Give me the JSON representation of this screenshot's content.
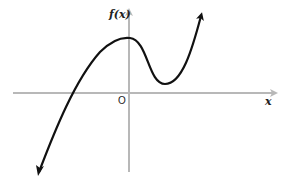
{
  "graph": {
    "y_axis_label": "f(x)",
    "x_axis_label": "x",
    "origin_label": "O",
    "colors": {
      "axis": "#b8b8b8",
      "curve": "#111111"
    },
    "curve": {
      "description": "cubic-like function with local max on y-axis and local min right of y-axis",
      "points": [
        [
          38,
          175
        ],
        [
          72,
          93
        ],
        [
          128,
          39
        ],
        [
          165,
          84
        ],
        [
          201,
          13
        ]
      ]
    }
  }
}
